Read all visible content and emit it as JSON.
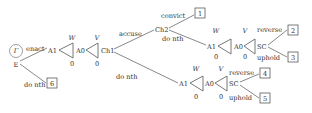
{
  "diagram": {
    "type": "game-tree",
    "start": {
      "player_label": "Γ",
      "node": "E"
    },
    "nodes": {
      "E": "E",
      "A1_first": "A1",
      "A0_first": "A0",
      "Ch1": "Ch1",
      "Ch2": "Ch2",
      "A1_upper": "A1",
      "A0_upper": "A0",
      "SC_upper": "SC",
      "A1_lower": "A1",
      "A0_lower": "A0",
      "SC_lower": "SC"
    },
    "edges": {
      "enact": "enact",
      "do_nth_E": "do nth",
      "accuse": "accuse",
      "do_nth_Ch1": "do nth",
      "convict": "convict",
      "do_nth_Ch2": "do nth",
      "reverse_upper": "reverse",
      "uphold_upper": "uphold",
      "reverse_lower": "reverse",
      "uphold_lower": "uphold"
    },
    "triangles": {
      "first_A1": {
        "top": "W",
        "bottom": "0"
      },
      "first_A0": {
        "top": "V",
        "bottom": "0"
      },
      "upper_A1": {
        "top": "W",
        "bottom": "0"
      },
      "upper_A0": {
        "top": "V",
        "bottom": "0"
      },
      "lower_A1": {
        "top": "W",
        "bottom": "0"
      },
      "lower_A0": {
        "top": "V",
        "bottom": "0"
      }
    },
    "outcomes": {
      "o1": "1",
      "o2": "2",
      "o3": "3",
      "o4": "4",
      "o5": "5",
      "o6": "6"
    }
  }
}
